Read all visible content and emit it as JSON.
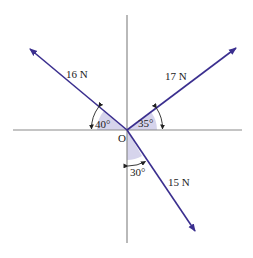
{
  "diagram": {
    "origin_label": "O",
    "colors": {
      "axis": "#8a8a8a",
      "force": "#3b2f8f",
      "shade": "#d6d4ec",
      "text": "#222222"
    },
    "forces": [
      {
        "label": "16 N",
        "angle_label": "40°",
        "reference": "negative x-axis",
        "direction": "up-left"
      },
      {
        "label": "17 N",
        "angle_label": "35°",
        "reference": "positive x-axis",
        "direction": "up-right"
      },
      {
        "label": "15 N",
        "angle_label": "30°",
        "reference": "negative y-axis",
        "direction": "down-right"
      }
    ]
  }
}
